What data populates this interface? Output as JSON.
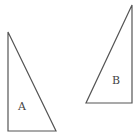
{
  "diagram": {
    "stroke_color": "#555555",
    "triangles": [
      {
        "label": "A",
        "points": [
          [
            8,
            32
          ],
          [
            8,
            131
          ],
          [
            56,
            131
          ]
        ],
        "label_pos": [
          18,
          110
        ]
      },
      {
        "label": "B",
        "points": [
          [
            132,
            5
          ],
          [
            132,
            103
          ],
          [
            86,
            103
          ]
        ],
        "label_pos": [
          112,
          84
        ]
      }
    ]
  }
}
